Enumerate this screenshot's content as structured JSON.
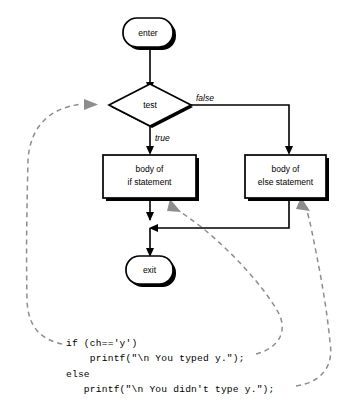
{
  "figure": {
    "kind": "flowchart",
    "background_color": "#ffffff",
    "line_color": "#000000",
    "dashed_link_color": "#8d8d8d"
  },
  "nodes": {
    "enter": {
      "label": "enter",
      "shape": "terminator-oval",
      "cx": 150,
      "cy": 33
    },
    "test": {
      "label": "test",
      "shape": "decision-diamond",
      "cx": 150,
      "cy": 105
    },
    "if_body": {
      "label_line1": "body of",
      "label_line2": "if statement",
      "shape": "process-box",
      "cx": 149,
      "cy": 176
    },
    "else_body": {
      "label_line1": "body of",
      "label_line2": "else statement",
      "shape": "process-box",
      "cx": 285,
      "cy": 176
    },
    "exit": {
      "label": "exit",
      "shape": "terminator-oval",
      "cx": 150,
      "cy": 269
    }
  },
  "edges": {
    "true_label": "true",
    "false_label": "false"
  },
  "code": {
    "lines": [
      "if (ch=='y')",
      "    printf(\"\\n You typed y.\");",
      "else",
      "   printf(\"\\n You didn't type y.\");"
    ]
  },
  "annotations": {
    "link_test_to_condition": "dashed link from if-condition code to test diamond",
    "link_ifbody_to_then": "dashed link from then-branch printf to body of if statement",
    "link_elsebody_to_else": "dashed link from else-branch printf to body of else statement"
  }
}
